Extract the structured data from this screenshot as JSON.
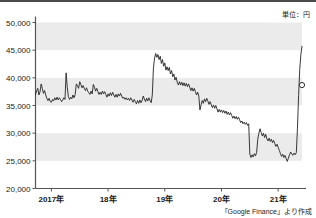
{
  "figure": {
    "unit_label": "単位：円",
    "source_label": "「Google Finance」より作成"
  },
  "chart_data": {
    "type": "line",
    "title": "",
    "subtitle": "",
    "xlabel": "",
    "ylabel": "",
    "unit_note": "単位：円",
    "source": "「Google Finance」より作成",
    "grid": "horizontal-bands",
    "legend": "none",
    "marker_note": "open circle marker at final data point",
    "ylim": [
      20000,
      50000
    ],
    "ytick_labels": [
      "50,000",
      "45,000",
      "40,000",
      "35,000",
      "30,000",
      "25,000",
      "20,000"
    ],
    "ytick_values": [
      50000,
      45000,
      40000,
      35000,
      30000,
      25000,
      20000
    ],
    "xtick_labels": [
      "2017年",
      "18年",
      "19年",
      "20年",
      "21年"
    ],
    "xtick_values": [
      2017.0,
      2018.0,
      2019.0,
      2020.0,
      2021.0
    ],
    "xlim": [
      2016.72,
      2021.42
    ],
    "band_ranges": [
      [
        45000,
        50000
      ],
      [
        35000,
        40000
      ],
      [
        25000,
        30000
      ]
    ],
    "final_value": 38700,
    "series": [
      {
        "name": "株価",
        "x": [
          2016.72,
          2016.74,
          2016.76,
          2016.78,
          2016.8,
          2016.82,
          2016.84,
          2016.86,
          2016.88,
          2016.9,
          2016.92,
          2016.94,
          2016.96,
          2016.98,
          2017.0,
          2017.02,
          2017.04,
          2017.06,
          2017.08,
          2017.1,
          2017.12,
          2017.14,
          2017.16,
          2017.18,
          2017.2,
          2017.22,
          2017.24,
          2017.26,
          2017.28,
          2017.3,
          2017.32,
          2017.34,
          2017.36,
          2017.38,
          2017.4,
          2017.42,
          2017.44,
          2017.46,
          2017.48,
          2017.5,
          2017.52,
          2017.54,
          2017.56,
          2017.58,
          2017.6,
          2017.62,
          2017.64,
          2017.66,
          2017.68,
          2017.7,
          2017.72,
          2017.74,
          2017.76,
          2017.78,
          2017.8,
          2017.82,
          2017.84,
          2017.86,
          2017.88,
          2017.9,
          2017.92,
          2017.94,
          2017.96,
          2017.98,
          2018.0,
          2018.02,
          2018.04,
          2018.06,
          2018.08,
          2018.1,
          2018.12,
          2018.14,
          2018.16,
          2018.18,
          2018.2,
          2018.22,
          2018.24,
          2018.26,
          2018.28,
          2018.3,
          2018.32,
          2018.34,
          2018.36,
          2018.38,
          2018.4,
          2018.42,
          2018.44,
          2018.46,
          2018.48,
          2018.5,
          2018.52,
          2018.54,
          2018.56,
          2018.58,
          2018.6,
          2018.62,
          2018.64,
          2018.66,
          2018.68,
          2018.7,
          2018.72,
          2018.74,
          2018.76,
          2018.78,
          2018.8,
          2018.82,
          2018.84,
          2018.86,
          2018.88,
          2018.9,
          2018.92,
          2018.94,
          2018.96,
          2018.98,
          2019.0,
          2019.02,
          2019.04,
          2019.06,
          2019.08,
          2019.1,
          2019.12,
          2019.14,
          2019.16,
          2019.18,
          2019.2,
          2019.22,
          2019.24,
          2019.26,
          2019.28,
          2019.3,
          2019.32,
          2019.34,
          2019.36,
          2019.38,
          2019.4,
          2019.42,
          2019.44,
          2019.46,
          2019.48,
          2019.5,
          2019.52,
          2019.54,
          2019.56,
          2019.58,
          2019.6,
          2019.62,
          2019.64,
          2019.66,
          2019.68,
          2019.7,
          2019.72,
          2019.74,
          2019.76,
          2019.78,
          2019.8,
          2019.82,
          2019.84,
          2019.86,
          2019.88,
          2019.9,
          2019.92,
          2019.94,
          2019.96,
          2019.98,
          2020.0,
          2020.02,
          2020.04,
          2020.06,
          2020.08,
          2020.1,
          2020.12,
          2020.14,
          2020.16,
          2020.18,
          2020.2,
          2020.22,
          2020.24,
          2020.26,
          2020.28,
          2020.3,
          2020.32,
          2020.34,
          2020.36,
          2020.38,
          2020.4,
          2020.42,
          2020.44,
          2020.46,
          2020.48,
          2020.5,
          2020.52,
          2020.54,
          2020.56,
          2020.58,
          2020.6,
          2020.62,
          2020.64,
          2020.66,
          2020.68,
          2020.7,
          2020.72,
          2020.74,
          2020.76,
          2020.78,
          2020.8,
          2020.82,
          2020.84,
          2020.86,
          2020.88,
          2020.9,
          2020.92,
          2020.94,
          2020.96,
          2020.98,
          2021.0,
          2021.02,
          2021.04,
          2021.06,
          2021.08,
          2021.1,
          2021.12,
          2021.14,
          2021.16,
          2021.18,
          2021.2,
          2021.22,
          2021.24,
          2021.26,
          2021.28,
          2021.3,
          2021.32,
          2021.34,
          2021.36,
          2021.38,
          2021.4,
          2021.42
        ],
        "y": [
          37000,
          37600,
          38100,
          36900,
          37500,
          38900,
          38100,
          37200,
          37700,
          36900,
          36300,
          35900,
          36300,
          35700,
          35600,
          36100,
          35800,
          36400,
          36000,
          36500,
          36000,
          36400,
          36100,
          35700,
          36000,
          36400,
          36100,
          40900,
          38300,
          36600,
          36100,
          36500,
          36200,
          36900,
          36400,
          37000,
          38900,
          38600,
          38100,
          39300,
          38800,
          38200,
          38600,
          38100,
          37700,
          38200,
          37600,
          37300,
          37000,
          37600,
          37100,
          38800,
          38300,
          37600,
          38100,
          37500,
          37000,
          37400,
          37000,
          37600,
          37100,
          37500,
          37000,
          36500,
          37100,
          36700,
          37300,
          36800,
          37400,
          36900,
          36500,
          37000,
          36500,
          37100,
          36700,
          37200,
          36700,
          36300,
          36500,
          36100,
          36400,
          36000,
          36300,
          35900,
          36400,
          36000,
          35600,
          36100,
          35700,
          35300,
          35900,
          35400,
          36000,
          35500,
          35900,
          36700,
          36200,
          35700,
          36300,
          35800,
          36400,
          35900,
          35500,
          36900,
          41800,
          43600,
          44400,
          43700,
          44200,
          43300,
          43900,
          42600,
          43300,
          42100,
          42700,
          41400,
          42000,
          41300,
          41900,
          40700,
          41300,
          40200,
          40700,
          39600,
          40100,
          39200,
          38700,
          39300,
          38700,
          39200,
          38600,
          39100,
          38500,
          39000,
          38400,
          38900,
          38300,
          37700,
          38200,
          37600,
          38100,
          37500,
          36900,
          37400,
          36700,
          34200,
          35100,
          35900,
          35400,
          36200,
          35700,
          36300,
          35800,
          35200,
          35700,
          35100,
          34600,
          35100,
          34500,
          35000,
          34400,
          33800,
          34300,
          33800,
          34200,
          33700,
          34100,
          33600,
          34000,
          33400,
          33800,
          33300,
          33700,
          33200,
          32700,
          33100,
          32600,
          33000,
          32500,
          32900,
          32400,
          31900,
          32200,
          31700,
          32000,
          31600,
          31900,
          31400,
          31700,
          26200,
          25600,
          26100,
          25700,
          26300,
          25900,
          26500,
          28900,
          30000,
          30800,
          30100,
          29500,
          30000,
          29200,
          29800,
          29000,
          28600,
          29100,
          28500,
          28900,
          28300,
          28700,
          28100,
          27600,
          28000,
          27400,
          26900,
          26300,
          25800,
          26200,
          25600,
          26000,
          25400,
          24900,
          25500,
          26100,
          26600,
          26200,
          26000,
          26400,
          26100,
          26500,
          30900,
          36800,
          41500,
          44200,
          45700
        ]
      }
    ]
  }
}
